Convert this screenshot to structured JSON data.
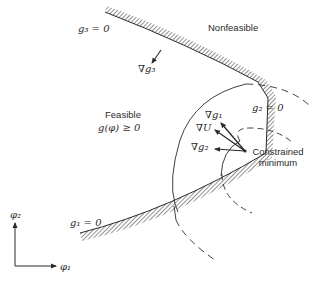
{
  "labels": {
    "nonfeasible": "Nonfeasible",
    "feasible": "Feasible",
    "feasible_condition": "g(φ) ≥ 0",
    "g3_boundary": "g₃ = 0",
    "g2_boundary": "g₂ = 0",
    "g1_boundary": "g₁ = 0",
    "grad_g3": "∇g₃",
    "grad_g1": "∇g₁",
    "grad_U": "∇U",
    "grad_g2": "∇g₂",
    "constrained_minimum_line1": "Constrained",
    "constrained_minimum_line2": "minimum",
    "axis_phi1": "φ₁",
    "axis_phi2": "φ₂"
  },
  "colors": {
    "ink": "#2a2a2a",
    "hatch": "#555555",
    "background": "#ffffff"
  }
}
